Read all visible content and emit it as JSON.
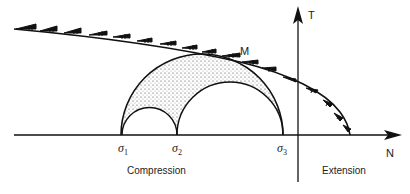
{
  "figure": {
    "axes": {
      "vertical_label": "T",
      "horizontal_label": "N"
    },
    "point_label": "M",
    "stress_labels": [
      {
        "symbol": "σ",
        "sub": "1"
      },
      {
        "symbol": "σ",
        "sub": "2"
      },
      {
        "symbol": "σ",
        "sub": "3"
      }
    ],
    "regions": {
      "left": "Compression",
      "right": "Extension"
    },
    "colors": {
      "ink": "#111111",
      "background": "#ffffff"
    }
  }
}
